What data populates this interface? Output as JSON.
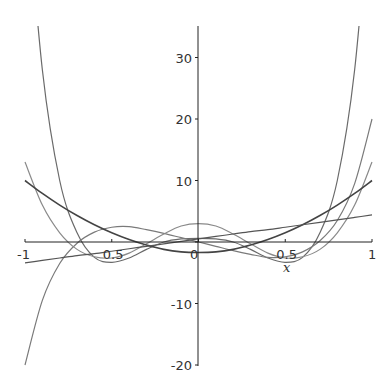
{
  "chart_data": {
    "type": "line",
    "title": "",
    "xlabel": "x",
    "ylabel": "",
    "xlim": [
      -1,
      1
    ],
    "ylim": [
      -20,
      35
    ],
    "grid": false,
    "legend": "none",
    "x_ticks": [
      {
        "value": -1,
        "label": "-1"
      },
      {
        "value": -0.5,
        "label": "0.5"
      },
      {
        "value": 0,
        "label": "0"
      },
      {
        "value": 0.5,
        "label": "0.5"
      },
      {
        "value": 1,
        "label": "1"
      }
    ],
    "y_ticks": [
      {
        "value": -20,
        "label": "-20"
      },
      {
        "value": -10,
        "label": "-10"
      },
      {
        "value": 0,
        "label": ""
      },
      {
        "value": 10,
        "label": "10"
      },
      {
        "value": 20,
        "label": "20"
      },
      {
        "value": 30,
        "label": "30"
      }
    ],
    "x": [
      -1,
      -0.9,
      -0.8,
      -0.7,
      -0.6,
      -0.5,
      -0.4,
      -0.3,
      -0.2,
      -0.1,
      0,
      0.1,
      0.2,
      0.3,
      0.4,
      0.5,
      0.6,
      0.7,
      0.8,
      0.9,
      1
    ],
    "series": [
      {
        "name": "degree-6 curve",
        "color": "#6a6a6a",
        "values": [
          60,
          28,
          10,
          1.5,
          -2.5,
          -3.3,
          -2.6,
          -1.2,
          0.0,
          0.5,
          0.6,
          0.5,
          0.0,
          -1.2,
          -2.6,
          -3.3,
          -2.5,
          1.5,
          10,
          28,
          60
        ]
      },
      {
        "name": "degree-5 curve",
        "color": "#7a7a7a",
        "values": [
          -20,
          -9.5,
          -3.5,
          -0.2,
          1.6,
          2.4,
          2.5,
          2.0,
          1.4,
          0.7,
          0.0,
          -0.7,
          -1.4,
          -2.0,
          -2.5,
          -2.4,
          -1.6,
          0.2,
          3.5,
          9.5,
          20
        ]
      },
      {
        "name": "degree-4 curve",
        "color": "#8a8a8a",
        "values": [
          13,
          6,
          1.5,
          -1.2,
          -2.4,
          -2.6,
          -1.8,
          -0.3,
          1.3,
          2.6,
          3.0,
          2.6,
          1.3,
          -0.3,
          -1.8,
          -2.6,
          -2.4,
          -1.2,
          1.5,
          6,
          13
        ]
      },
      {
        "name": "parabola",
        "color": "#444444",
        "values": [
          10,
          7.9,
          6.0,
          4.3,
          2.8,
          1.5,
          0.4,
          -0.5,
          -1.2,
          -1.6,
          -1.7,
          -1.6,
          -1.2,
          -0.5,
          0.4,
          1.5,
          2.8,
          4.3,
          6.0,
          7.9,
          10
        ]
      },
      {
        "name": "line",
        "color": "#555555",
        "values": [
          -3.4,
          -3.0,
          -2.6,
          -2.2,
          -1.9,
          -1.5,
          -1.1,
          -0.7,
          -0.3,
          0.1,
          0.5,
          0.9,
          1.3,
          1.7,
          2.0,
          2.4,
          2.8,
          3.2,
          3.6,
          4.0,
          4.4
        ]
      }
    ]
  },
  "axes": {
    "x_label": "x",
    "origin_label": "0"
  }
}
